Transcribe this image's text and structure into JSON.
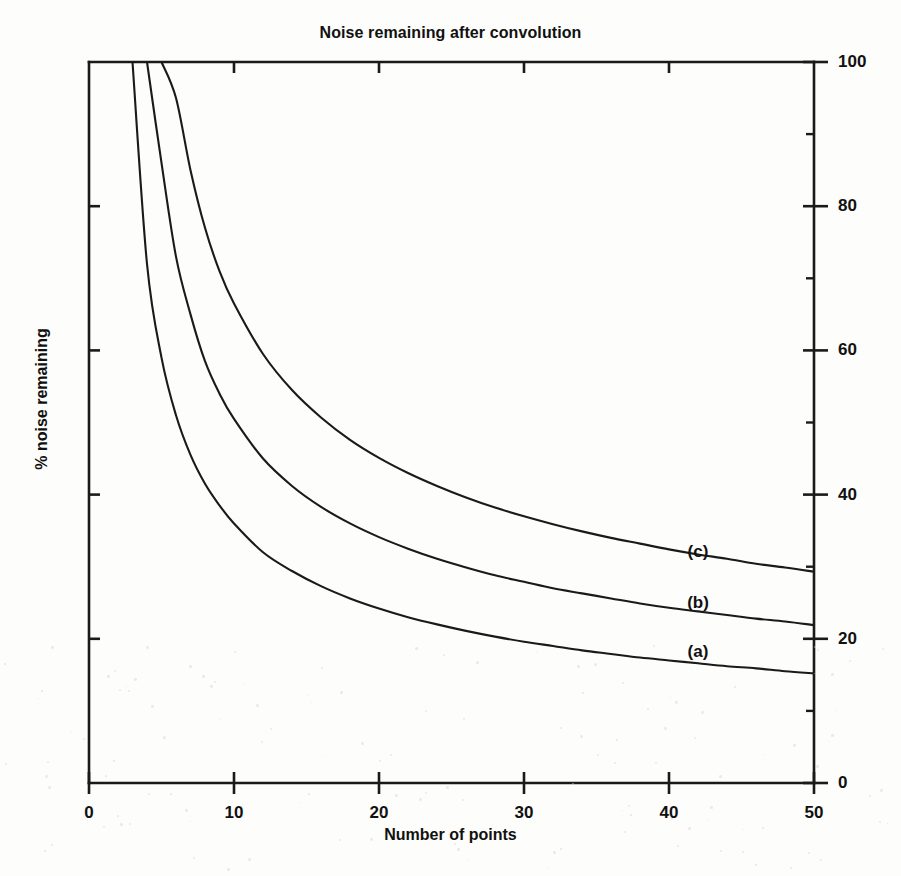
{
  "figure": {
    "background_color": "#fdfdfb",
    "ink_color": "#1a1a1a"
  },
  "chart_data": {
    "type": "line",
    "title": "Noise remaining after convolution",
    "xlabel": "Number of points",
    "ylabel": "% noise remaining",
    "xlim": [
      0,
      50
    ],
    "ylim": [
      0,
      100
    ],
    "xticks": [
      0,
      10,
      20,
      30,
      40,
      50
    ],
    "xtick_labels": [
      "0",
      "10",
      "20",
      "30",
      "40",
      "50"
    ],
    "yticks": [
      0,
      20,
      40,
      60,
      80,
      100
    ],
    "ytick_labels": [
      "0",
      "20",
      "40",
      "60",
      "80",
      "100"
    ],
    "yminorticks": [
      10,
      30,
      50,
      70,
      90
    ],
    "y_axis_position": "right",
    "grid": false,
    "legend": "inline-curve-labels",
    "x": [
      3,
      4,
      5,
      6,
      7,
      8,
      9,
      10,
      12,
      14,
      16,
      18,
      20,
      22,
      24,
      26,
      28,
      30,
      32,
      34,
      36,
      38,
      40,
      42,
      44,
      46,
      48,
      50
    ],
    "series": [
      {
        "name": "(a)",
        "label": "(a)",
        "label_x": 42,
        "label_y": 18.2,
        "values": [
          100,
          72,
          59,
          51,
          45.5,
          41.5,
          38.5,
          36,
          32,
          29.4,
          27.3,
          25.6,
          24.2,
          23.0,
          22.0,
          21.1,
          20.3,
          19.6,
          19.0,
          18.4,
          17.9,
          17.4,
          17.0,
          16.6,
          16.2,
          15.9,
          15.5,
          15.2
        ]
      },
      {
        "name": "(b)",
        "label": "(b)",
        "label_x": 42,
        "label_y": 25.0,
        "values": [
          null,
          100,
          86,
          73,
          65,
          58.5,
          54,
          50.5,
          45,
          41.2,
          38.3,
          36.0,
          34.1,
          32.5,
          31.1,
          29.9,
          28.8,
          27.9,
          27.0,
          26.3,
          25.6,
          24.9,
          24.3,
          23.8,
          23.3,
          22.8,
          22.4,
          21.9
        ]
      },
      {
        "name": "(c)",
        "label": "(c)",
        "label_x": 42,
        "label_y": 32.0,
        "values": [
          null,
          null,
          100,
          95,
          85,
          77,
          71,
          66.5,
          59.5,
          54.5,
          50.7,
          47.6,
          45.1,
          43.0,
          41.2,
          39.6,
          38.2,
          37.0,
          35.9,
          34.9,
          34.0,
          33.2,
          32.4,
          31.7,
          31.1,
          30.4,
          29.9,
          29.3
        ]
      }
    ]
  }
}
